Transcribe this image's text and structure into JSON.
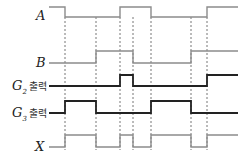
{
  "diagram": {
    "type": "timing",
    "signals": [
      {
        "id": "A",
        "label": "A",
        "sub": "",
        "suffix": "",
        "y_high": 7,
        "y_low": 17,
        "color": "#8c8c8c",
        "weight": 1.4,
        "initial": 1,
        "transitions": [
          65,
          120,
          151,
          207
        ]
      },
      {
        "id": "B",
        "label": "B",
        "sub": "",
        "suffix": "",
        "y_high": 51,
        "y_low": 63,
        "color": "#8c8c8c",
        "weight": 1.4,
        "initial": 0,
        "transitions": [
          96,
          133,
          191
        ]
      },
      {
        "id": "G2",
        "label": "G",
        "sub": "2",
        "suffix": "출력",
        "y_high": 75,
        "y_low": 86,
        "color": "#222222",
        "weight": 1.8,
        "initial": 0,
        "transitions": [
          120,
          133,
          207
        ]
      },
      {
        "id": "G3",
        "label": "G",
        "sub": "3",
        "suffix": "출력",
        "y_high": 101,
        "y_low": 113,
        "color": "#222222",
        "weight": 1.8,
        "initial": 0,
        "transitions": [
          65,
          96,
          151,
          191
        ]
      },
      {
        "id": "X",
        "label": "X",
        "sub": "",
        "suffix": "",
        "y_high": 135,
        "y_low": 147,
        "color": "#8c8c8c",
        "weight": 1.4,
        "initial": 0,
        "transitions": [
          65,
          96,
          120,
          133,
          151,
          191,
          207
        ]
      }
    ],
    "x_start": 49,
    "x_end": 238,
    "guide_lines": [
      65,
      96,
      120,
      133,
      151,
      191,
      207
    ],
    "guide_color": "#777777"
  }
}
